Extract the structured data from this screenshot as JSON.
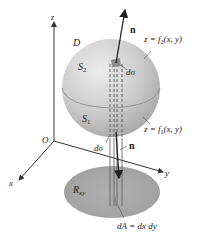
{
  "diagram": {
    "labels": {
      "z_axis": "z",
      "x_axis": "x",
      "y_axis": "y",
      "origin": "O",
      "region_D": "D",
      "upper_surface": "S",
      "upper_surface_sub": "2",
      "lower_surface": "S",
      "lower_surface_sub": "1",
      "upper_eq_prefix": "z = f",
      "upper_eq_sub": "2",
      "upper_eq_suffix": "(x, y)",
      "lower_eq_prefix": "z = f",
      "lower_eq_sub": "1",
      "lower_eq_suffix": "(x, y)",
      "normal_upper": "n",
      "normal_lower": "n",
      "dsigma_upper": "dσ",
      "dsigma_lower": "dσ",
      "region_R": "R",
      "region_R_sub": "xy",
      "area_element": "dA = dx dy"
    },
    "colors": {
      "sphere_light": "#e4e4e4",
      "sphere_dark": "#a9a9a9",
      "region_fill": "#a6a6a6",
      "axis": "#333333",
      "patch": "#8c8c8c"
    }
  }
}
